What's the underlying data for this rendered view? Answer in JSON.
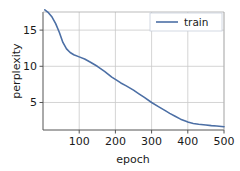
{
  "chart_data": {
    "type": "line",
    "title": "",
    "xlabel": "epoch",
    "ylabel": "perplexity",
    "xlim": [
      0,
      500
    ],
    "ylim": [
      1.2,
      17.5
    ],
    "xticks": [
      100,
      200,
      300,
      400,
      500
    ],
    "yticks": [
      5,
      10,
      15
    ],
    "xtick_labels": [
      "100",
      "200",
      "300",
      "400",
      "500"
    ],
    "ytick_labels": [
      "5",
      "10",
      "15"
    ],
    "grid": true,
    "legend_position": "upper right",
    "series": [
      {
        "name": "train",
        "color": "#4c6fa5",
        "x": [
          5,
          15,
          25,
          35,
          45,
          55,
          65,
          75,
          85,
          100,
          115,
          130,
          150,
          170,
          190,
          200,
          215,
          230,
          250,
          265,
          280,
          300,
          320,
          340,
          350,
          365,
          380,
          395,
          400,
          415,
          430,
          450,
          465,
          480,
          500
        ],
        "y": [
          17.8,
          17.4,
          16.8,
          15.9,
          14.7,
          13.3,
          12.4,
          11.9,
          11.6,
          11.3,
          11.0,
          10.6,
          10.0,
          9.3,
          8.5,
          8.2,
          7.7,
          7.3,
          6.7,
          6.2,
          5.7,
          5.0,
          4.4,
          3.8,
          3.5,
          3.1,
          2.7,
          2.4,
          2.3,
          2.1,
          2.0,
          1.9,
          1.8,
          1.75,
          1.65
        ]
      }
    ]
  },
  "legend": {
    "entries": [
      {
        "label": "train",
        "color": "#4c6fa5"
      }
    ]
  },
  "axes": {
    "x_title": "epoch",
    "y_title": "perplexity"
  }
}
